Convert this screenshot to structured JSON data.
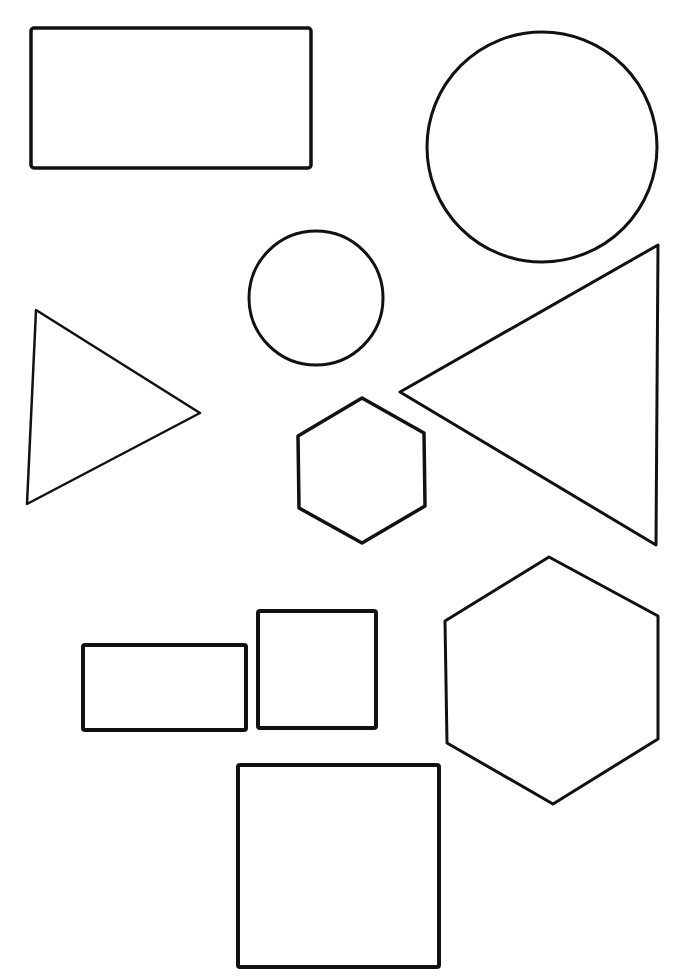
{
  "page": {
    "title": "Geometric shapes worksheet",
    "width": 692,
    "height": 980,
    "background": "#ffffff",
    "stroke_color": "#111111"
  },
  "shapes": [
    {
      "id": "large-rectangle",
      "type": "rectangle",
      "label": "Large rectangle",
      "x": 31,
      "y": 28,
      "w": 280,
      "h": 140,
      "stroke_width": 3.5,
      "rx": 3
    },
    {
      "id": "large-circle",
      "type": "circle",
      "label": "Large circle",
      "cx": 542,
      "cy": 147,
      "r": 115,
      "stroke_width": 3
    },
    {
      "id": "small-circle",
      "type": "circle",
      "label": "Small circle",
      "cx": 316,
      "cy": 298,
      "r": 67,
      "stroke_width": 3
    },
    {
      "id": "left-triangle",
      "type": "polygon",
      "label": "Triangle pointing right",
      "points": "36,310 200,413 27,504",
      "stroke_width": 2.5
    },
    {
      "id": "large-triangle",
      "type": "polygon",
      "label": "Large triangle pointing left",
      "points": "658,245 400,392 656,545",
      "stroke_width": 3
    },
    {
      "id": "small-hexagon",
      "type": "polygon",
      "label": "Small hexagon",
      "points": "362,398 424,433 425,506 362,543 299,508 298,436",
      "stroke_width": 3.5
    },
    {
      "id": "large-hexagon",
      "type": "polygon",
      "label": "Large hexagon",
      "points": "549,557 658,616 658,739 553,804 447,743 445,621",
      "stroke_width": 3
    },
    {
      "id": "small-rectangle",
      "type": "rectangle",
      "label": "Small rectangle",
      "x": 83,
      "y": 645,
      "w": 163,
      "h": 85,
      "stroke_width": 4,
      "rx": 2
    },
    {
      "id": "small-square",
      "type": "rectangle",
      "label": "Small square",
      "x": 258,
      "y": 611,
      "w": 118,
      "h": 117,
      "stroke_width": 4,
      "rx": 2
    },
    {
      "id": "large-square",
      "type": "rectangle",
      "label": "Large square",
      "x": 238,
      "y": 765,
      "w": 201,
      "h": 202,
      "stroke_width": 4,
      "rx": 2
    }
  ]
}
